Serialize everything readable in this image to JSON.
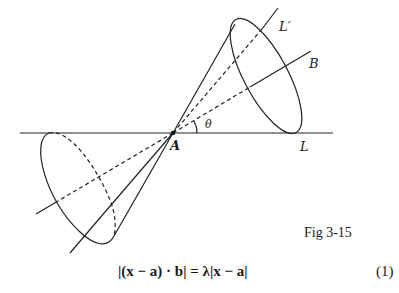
{
  "figure": {
    "caption": "Fig 3-15",
    "labels": {
      "point_a": "A",
      "line_l": "L",
      "line_l_prime": "L′",
      "axis_b": "B",
      "angle": "θ"
    }
  },
  "equation": {
    "text": "|(x − a) · b| = λ|x − a|",
    "number": "(1)"
  },
  "colors": {
    "stroke": "#222222",
    "background": "#ffffff"
  }
}
